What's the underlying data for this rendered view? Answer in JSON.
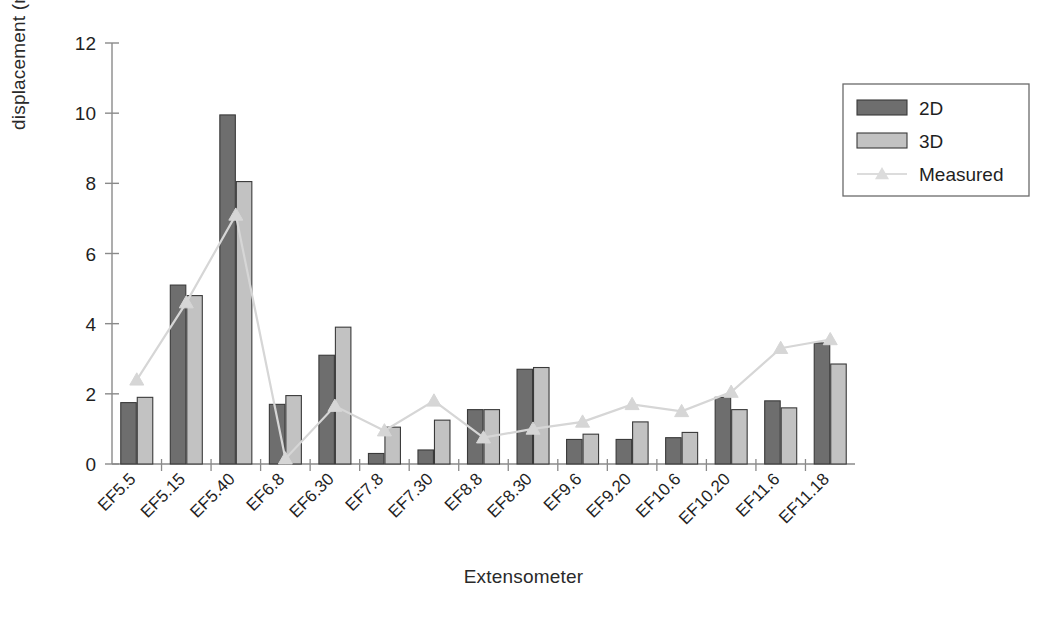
{
  "chart_data": {
    "type": "bar",
    "title": "",
    "xlabel": "Extensometer",
    "ylabel": "displacement (mm)",
    "ylim": [
      0,
      12
    ],
    "yticks": [
      0,
      2,
      4,
      6,
      8,
      10,
      12
    ],
    "ytick_labels": [
      "0",
      "2",
      "4",
      "6",
      "8",
      "10",
      "12"
    ],
    "grid": false,
    "legend_position": "top-right",
    "categories": [
      "EF5.5",
      "EF5.15",
      "EF5.40",
      "EF6.8",
      "EF6.30",
      "EF7.8",
      "EF7.30",
      "EF8.8",
      "EF8.30",
      "EF9.6",
      "EF9.20",
      "EF10.6",
      "EF10.20",
      "EF11.6",
      "EF11.18"
    ],
    "series": [
      {
        "name": "2D",
        "kind": "bar",
        "color": "#6e6e6e",
        "values": [
          1.75,
          5.1,
          9.95,
          1.7,
          3.1,
          0.3,
          0.4,
          1.55,
          2.7,
          0.7,
          0.7,
          0.75,
          1.9,
          1.8,
          3.45
        ]
      },
      {
        "name": "3D",
        "kind": "bar",
        "color": "#c2c2c2",
        "values": [
          1.9,
          4.8,
          8.05,
          1.95,
          3.9,
          1.05,
          1.25,
          1.55,
          2.75,
          0.85,
          1.2,
          0.9,
          1.55,
          1.6,
          2.85
        ]
      },
      {
        "name": "Measured",
        "kind": "line",
        "color": "#d6d6d6",
        "marker": "triangle",
        "values": [
          2.4,
          4.6,
          7.1,
          0.15,
          1.65,
          0.95,
          1.8,
          0.75,
          1.0,
          1.2,
          1.7,
          1.5,
          2.05,
          3.3,
          3.55
        ]
      }
    ]
  },
  "legend": {
    "items": [
      {
        "label": "2D",
        "swatch": "bar",
        "color": "#6e6e6e"
      },
      {
        "label": "3D",
        "swatch": "bar",
        "color": "#c2c2c2"
      },
      {
        "label": "Measured",
        "swatch": "line-marker",
        "color": "#dcdcdc"
      }
    ]
  },
  "axes": {
    "x_title": "Extensometer",
    "y_title": "displacement (mm)"
  }
}
